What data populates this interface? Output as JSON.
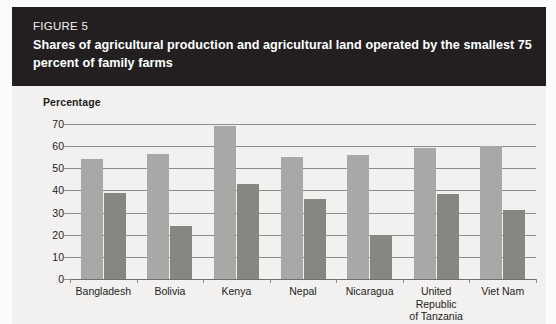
{
  "header": {
    "figure_label": "FIGURE 5",
    "title": "Shares of agricultural production and agricultural land operated by the smallest 75 percent of family farms"
  },
  "chart_data": {
    "type": "bar",
    "title": "Shares of agricultural production and agricultural land operated by the smallest 75 percent of family farms",
    "xlabel": "",
    "ylabel": "Percentage",
    "ylim": [
      0,
      70
    ],
    "yticks": [
      0,
      10,
      20,
      30,
      40,
      50,
      60,
      70
    ],
    "ytick_labels": [
      "0",
      "10",
      "20",
      "30",
      "40",
      "50",
      "60",
      "70"
    ],
    "grid": true,
    "legend": false,
    "categories": [
      "Bangladesh",
      "Bolivia",
      "Kenya",
      "Nepal",
      "Nicaragua",
      "United\nRepublic\nof Tanzania",
      "Viet Nam"
    ],
    "series": [
      {
        "name": "Share of agricultural production",
        "color": "#a9a8a6",
        "values": [
          54,
          56.5,
          69,
          55,
          56,
          59,
          60
        ]
      },
      {
        "name": "Share of agricultural land",
        "color": "#878683",
        "values": [
          39,
          24,
          43,
          36,
          20,
          38.5,
          31
        ]
      }
    ]
  },
  "colors": {
    "header_background": "#231f20",
    "panel_background": "#f2f1ef",
    "bar_light": "#a9a8a6",
    "bar_dark": "#878683",
    "gridline": "#8d8d8b",
    "text": "#1d1d1b"
  }
}
